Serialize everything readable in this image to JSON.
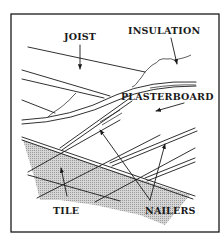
{
  "diagram": {
    "labels": {
      "joist": "JOIST",
      "insulation": "INSULATION",
      "plasterboard": "PLASTERBOARD",
      "tile": "TILE",
      "nailers": "NAILERS"
    },
    "colors": {
      "ink": "#1a1a1a",
      "tile_fill": "#c8c8c8",
      "background": "#ffffff"
    }
  }
}
